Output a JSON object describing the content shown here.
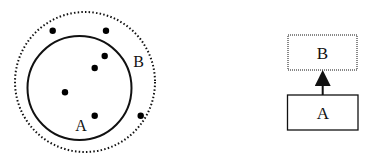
{
  "diagram": {
    "colors": {
      "stroke": "#111111",
      "dot": "#000000",
      "background": "#ffffff"
    },
    "set_view": {
      "outer_set": {
        "label": "B",
        "border_style": "dotted"
      },
      "inner_set": {
        "label": "A",
        "border_style": "solid"
      },
      "points": [
        {
          "id": "p1",
          "region": "B only"
        },
        {
          "id": "p2",
          "region": "B only"
        },
        {
          "id": "p3",
          "region": "A"
        },
        {
          "id": "p4",
          "region": "A"
        },
        {
          "id": "p5",
          "region": "A"
        },
        {
          "id": "p6",
          "region": "A"
        },
        {
          "id": "p7",
          "region": "B only"
        }
      ]
    },
    "hierarchy_view": {
      "top_box": {
        "label": "B",
        "border_style": "dotted"
      },
      "bottom_box": {
        "label": "A",
        "border_style": "solid"
      },
      "arrow": {
        "from": "A",
        "to": "B"
      }
    }
  }
}
